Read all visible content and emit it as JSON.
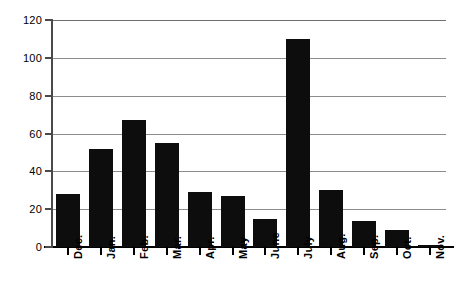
{
  "chart_data": {
    "type": "bar",
    "title": "",
    "subtitle": "",
    "xlabel": "",
    "ylabel": "",
    "categories": [
      "Dec.",
      "Jan.",
      "Feb.",
      "Mar.",
      "Apr.",
      "May",
      "June",
      "July",
      "Aug.",
      "Sep.",
      "Oct.",
      "Nov."
    ],
    "values": [
      28,
      52,
      67,
      55,
      29,
      27,
      15,
      110,
      30,
      14,
      9,
      1
    ],
    "ylim": [
      0,
      120
    ],
    "yticks": [
      0,
      20,
      40,
      60,
      80,
      100,
      120
    ],
    "ytick_labels": [
      "0",
      "20",
      "40",
      "60",
      "80",
      "100",
      "120"
    ],
    "grid": true,
    "grid_axis": "y",
    "legend": false,
    "legend_position": "none",
    "bar_color": "#0d0d0d",
    "grid_color": "#8d8d8d",
    "axis_color": "#000000",
    "background_color": "#ffffff"
  }
}
